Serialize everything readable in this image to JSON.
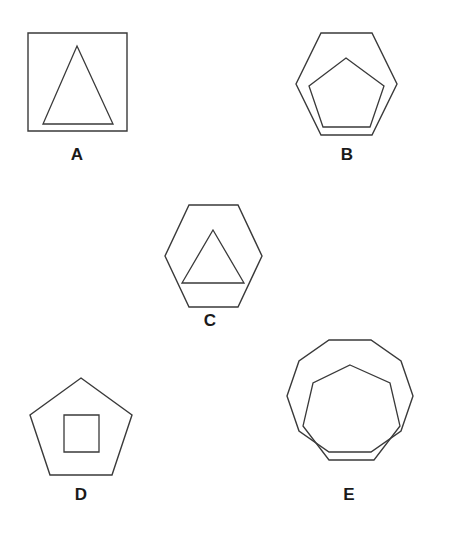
{
  "sheet": {
    "title": "Geometric figures A-E",
    "width": 451,
    "height": 538,
    "background_color": "#ffffff",
    "stroke_color": "#3a3a3a",
    "label_color": "#1a1a1a"
  },
  "figures": [
    {
      "id": "A",
      "label": "A",
      "outer_shape": "square",
      "outer_sides": 4,
      "inner_shape": "triangle",
      "inner_sides": 3,
      "outer_points": "28,33 127,33 127,131 28,131",
      "inner_points": "77,46 113,124 43,124",
      "label_x": 77,
      "label_y": 155
    },
    {
      "id": "B",
      "label": "B",
      "outer_shape": "hexagon",
      "outer_sides": 6,
      "inner_shape": "pentagon",
      "inner_sides": 5,
      "outer_points": "321,33 372,33 397,84 372,135 321,135 296,84",
      "inner_points": "346,58 384,86 370,127 323,127 309,86",
      "label_x": 347,
      "label_y": 155
    },
    {
      "id": "C",
      "label": "C",
      "outer_shape": "hexagon",
      "outer_sides": 6,
      "inner_shape": "triangle",
      "inner_sides": 3,
      "outer_points": "189,205 238,205 262,256 238,307 189,307 165,256",
      "inner_points": "213,230 244,283 182,283",
      "label_x": 210,
      "label_y": 321
    },
    {
      "id": "D",
      "label": "D",
      "outer_shape": "pentagon",
      "outer_sides": 5,
      "inner_shape": "square",
      "inner_sides": 4,
      "outer_points": "81,378 132,415 112,475 50,475 30,415",
      "inner_points": "64,415 99,415 99,452 64,452",
      "label_x": 81,
      "label_y": 495
    },
    {
      "id": "E",
      "label": "E",
      "outer_shape": "decagon",
      "outer_sides": 10,
      "inner_shape": "heptagon",
      "inner_sides": 7,
      "outer_points": "329,340 371,340 401,361 413,396 401,431 371,452 329,452 299,431 287,396 299,361",
      "inner_points": "350,365 390,383 400,426 374,460 329,460 303,426 313,383",
      "label_x": 349,
      "label_y": 495
    }
  ]
}
